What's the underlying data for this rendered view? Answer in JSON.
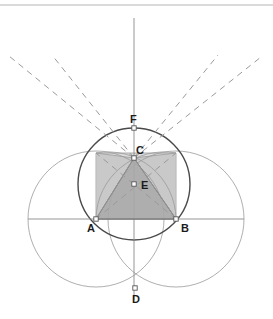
{
  "figure": {
    "width": 273,
    "height": 319,
    "background_color": "#ffffff"
  },
  "colors": {
    "primary_stroke": "#4a4a4a",
    "light_stroke": "#9a9a9a",
    "dashed_stroke": "#9a9a9a",
    "axis_stroke": "#8a8a8a",
    "square_fill": "#d8d8d8",
    "triangle_fill": "#a8a8a8",
    "wedge_fill": "#c2c2c2",
    "point_fill": "#ffffff",
    "point_stroke": "#555555",
    "label_color": "#1b1b1b",
    "top_rule": "#b5b5b5"
  },
  "points": [
    {
      "name": "A",
      "label": "A",
      "x": 96,
      "y": 219,
      "label_dx": -9,
      "label_dy": 13
    },
    {
      "name": "B",
      "label": "B",
      "x": 176,
      "y": 219,
      "label_dx": 5,
      "label_dy": 13
    },
    {
      "name": "C",
      "label": "C",
      "x": 134,
      "y": 158,
      "label_dx": 2,
      "label_dy": -4
    },
    {
      "name": "D",
      "label": "D",
      "x": 135,
      "y": 288,
      "label_dx": -3,
      "label_dy": 15
    },
    {
      "name": "E",
      "label": "E",
      "x": 134,
      "y": 184,
      "label_dx": 7,
      "label_dy": 5
    },
    {
      "name": "F",
      "label": "F",
      "x": 134,
      "y": 128,
      "label_dx": -4,
      "label_dy": -5
    }
  ],
  "circles": [
    {
      "name": "circle-centered-A",
      "cx": 96,
      "cy": 219,
      "r": 68,
      "style": "light"
    },
    {
      "name": "circle-centered-B",
      "cx": 176,
      "cy": 219,
      "r": 68,
      "style": "light"
    },
    {
      "name": "circumcircle-of-triangle",
      "cx": 134,
      "cy": 184,
      "r": 56,
      "style": "primary"
    }
  ],
  "arcs": [
    {
      "name": "arc-through-C-from-A",
      "d": "M 96 153 A 68 68 0 0 1 176 219",
      "style": "light"
    },
    {
      "name": "arc-through-C-from-B",
      "d": "M 176 153 A 68 68 0 0 0 96 219",
      "style": "light"
    }
  ],
  "axes": [
    {
      "name": "vertical-axis",
      "x1": 134,
      "y1": 18,
      "x2": 134,
      "y2": 300
    },
    {
      "name": "horizontal-axis",
      "x1": 28,
      "y1": 219,
      "x2": 244,
      "y2": 219
    }
  ],
  "square": {
    "name": "bounding-square",
    "points": "96,153 176,153 176,219 96,219"
  },
  "triangle": {
    "name": "equilateral-triangle-ACB",
    "points": "96,219 134,158 176,219"
  },
  "wedges": [
    {
      "name": "wedge-left",
      "points": "96,153 134,158 96,219"
    },
    {
      "name": "wedge-right",
      "points": "176,153 134,158 176,219"
    }
  ],
  "solid_rays": [
    {
      "name": "ray-C-to-A",
      "x1": 134,
      "y1": 158,
      "x2": 96,
      "y2": 219
    },
    {
      "name": "ray-C-to-B",
      "x1": 134,
      "y1": 158,
      "x2": 176,
      "y2": 219
    },
    {
      "name": "ray-C-to-square-top-left",
      "x1": 134,
      "y1": 158,
      "x2": 96,
      "y2": 153
    },
    {
      "name": "ray-C-to-square-top-right",
      "x1": 134,
      "y1": 158,
      "x2": 176,
      "y2": 153
    }
  ],
  "dashed_rays": [
    {
      "name": "dashed-ray-upper-left",
      "x1": 134,
      "y1": 158,
      "x2": 52,
      "y2": 55
    },
    {
      "name": "dashed-ray-upper-right",
      "x1": 134,
      "y1": 158,
      "x2": 218,
      "y2": 55
    },
    {
      "name": "dashed-ray-left",
      "x1": 134,
      "y1": 158,
      "x2": 9,
      "y2": 56
    },
    {
      "name": "dashed-ray-right",
      "x1": 134,
      "y1": 158,
      "x2": 261,
      "y2": 57
    },
    {
      "name": "dashed-chord-A-to-upper-right",
      "x1": 96,
      "y1": 219,
      "x2": 176,
      "y2": 153
    },
    {
      "name": "dashed-chord-B-to-upper-left",
      "x1": 176,
      "y1": 219,
      "x2": 96,
      "y2": 153
    }
  ],
  "top_rule": {
    "name": "top-horizontal-rule",
    "x1": 0,
    "y1": 5,
    "x2": 273,
    "y2": 5
  },
  "legend": {
    "point_labels": [
      "A",
      "B",
      "C",
      "D",
      "E",
      "F"
    ]
  }
}
